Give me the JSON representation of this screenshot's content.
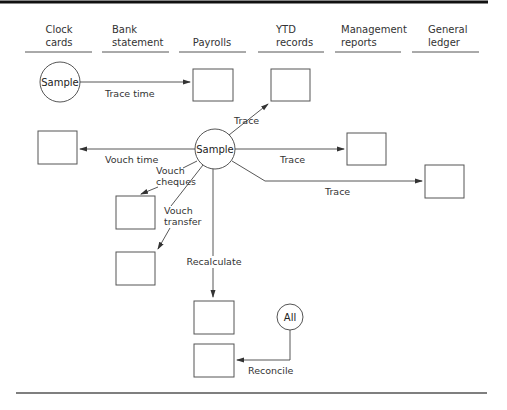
{
  "columns": [
    {
      "line1": "Clock",
      "line2": "cards"
    },
    {
      "line1": "Bank",
      "line2": "statement"
    },
    {
      "line1": "",
      "line2": "Payrolls"
    },
    {
      "line1": "YTD",
      "line2": "records"
    },
    {
      "line1": "Management",
      "line2": "reports"
    },
    {
      "line1": "General",
      "line2": "ledger"
    }
  ],
  "nodes": {
    "sample_top": "Sample",
    "sample_center": "Sample",
    "all": "All"
  },
  "edges": {
    "trace_time": "Trace time",
    "trace_ytd": "Trace",
    "vouch_time": "Vouch time",
    "trace_mgmt": "Trace",
    "trace_gl": "Trace",
    "vouch_cheques_1": "Vouch",
    "vouch_cheques_2": "cheques",
    "vouch_transfer_1": "Vouch",
    "vouch_transfer_2": "transfer",
    "recalculate": "Recalculate",
    "reconcile": "Reconcile"
  },
  "colors": {
    "line": "#444444",
    "text": "#333333",
    "border": "#111111"
  }
}
